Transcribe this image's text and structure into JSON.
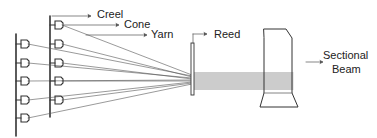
{
  "diagram": {
    "labels": {
      "creel": "Creel",
      "cone": "Cone",
      "yarn": "Yarn",
      "reed": "Reed",
      "beam_line1": "Sectional",
      "beam_line2": "Beam"
    },
    "components": [
      "Creel",
      "Cone",
      "Yarn",
      "Reed",
      "Sectional Beam"
    ],
    "creel_columns": 2,
    "cones_per_column": 5,
    "colors": {
      "line": "#333333",
      "text": "#222222",
      "background": "#ffffff"
    }
  }
}
